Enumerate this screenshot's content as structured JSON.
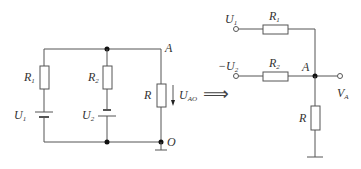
{
  "left_circuit": {
    "node_top_label": "A",
    "node_bottom_label": "O",
    "branch1": {
      "resistor": "R",
      "resistor_sub": "1",
      "source": "U",
      "source_sub": "1"
    },
    "branch2": {
      "resistor": "R",
      "resistor_sub": "2",
      "source": "U",
      "source_sub": "2"
    },
    "load": {
      "resistor": "R",
      "voltage": "U",
      "voltage_sub": "AO"
    }
  },
  "equivalence_symbol": "⟹",
  "right_circuit": {
    "input1": {
      "label": "U",
      "label_sub": "1",
      "resistor": "R",
      "resistor_sub": "1"
    },
    "input2": {
      "label": "−U",
      "label_sub": "2",
      "resistor": "R",
      "resistor_sub": "2"
    },
    "node_label": "A",
    "output": {
      "label": "V",
      "label_sub": "A"
    },
    "load_resistor": "R"
  }
}
